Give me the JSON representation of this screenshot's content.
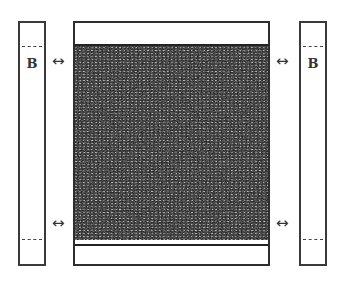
{
  "diagram": {
    "left_strip": {
      "label": "B"
    },
    "right_strip": {
      "label": "B"
    },
    "arrows": {
      "glyph": "↔"
    },
    "center_panel": {
      "fill": "stippled-dark"
    },
    "colors": {
      "stroke": "#2e2e2e",
      "fill_dark": "#555555",
      "background": "#ffffff"
    }
  }
}
